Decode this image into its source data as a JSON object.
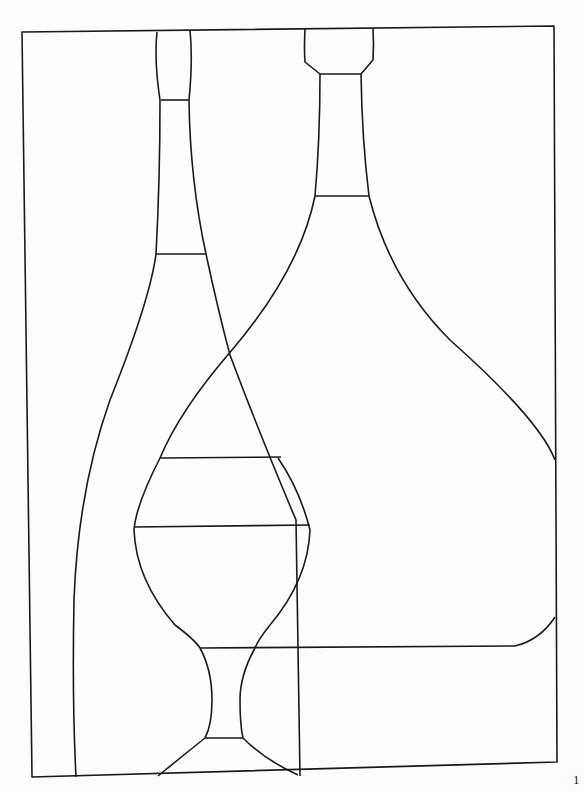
{
  "artwork": {
    "subject": "Stained-glass style line drawing of two bottles and a goblet",
    "line_color": "#1a1a1a",
    "background_color": "#fdfdfd"
  },
  "page_number": "1"
}
